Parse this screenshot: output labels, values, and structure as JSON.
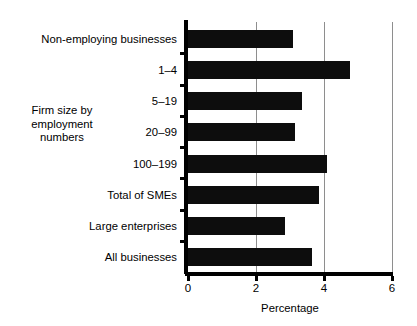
{
  "chart_data": {
    "type": "bar",
    "orientation": "horizontal",
    "title": "",
    "xlabel": "Percentage",
    "ylabel": "Firm size by\nemployment\nnumbers",
    "categories": [
      "Non-employing businesses",
      "1–4",
      "5–19",
      "20–99",
      "100–199",
      "Total of SMEs",
      "Large enterprises",
      "All  businesses"
    ],
    "values": [
      3.1,
      4.75,
      3.35,
      3.15,
      4.1,
      3.85,
      2.85,
      3.65
    ],
    "xlim": [
      0,
      6
    ],
    "xticks": [
      0,
      2,
      4,
      6
    ],
    "xtick_labels": [
      "0",
      "2",
      "4",
      "6"
    ],
    "grid": "vertical-only",
    "legend": "none",
    "bar_color": "#0d0d0d",
    "grid_color": "#8e8e8e",
    "axis_color": "#000000",
    "background": "#ffffff"
  }
}
